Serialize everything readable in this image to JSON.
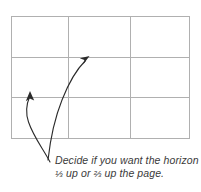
{
  "diagram": {
    "type": "rule-of-thirds-grid",
    "grid": {
      "columns": 3,
      "rows": 3,
      "left": 11,
      "top": 16,
      "right": 190,
      "bottom": 138,
      "vertical_dividers": [
        68,
        130
      ],
      "horizontal_dividers": [
        57,
        97
      ],
      "line_color": "#b0b0b0"
    },
    "arrows": [
      {
        "name": "arrow-to-lower-third",
        "from": [
          50,
          162
        ],
        "to": [
          30,
          93
        ],
        "color": "#2b2b2b"
      },
      {
        "name": "arrow-to-upper-third",
        "from": [
          48,
          160
        ],
        "to": [
          88,
          58
        ],
        "color": "#2b2b2b"
      }
    ]
  },
  "caption": {
    "line1": "Decide if you want the horizon",
    "line2_prefix": "",
    "fraction_low": "⅓",
    "middle": " up or ",
    "fraction_high": "⅔",
    "line2_suffix": " up the page.",
    "full_text": "Decide if you want the horizon ⅓ up or ⅔ up the page.",
    "text_color": "#3a3a3a"
  },
  "page": {
    "background": "#ffffff",
    "width": 201,
    "height": 192
  }
}
